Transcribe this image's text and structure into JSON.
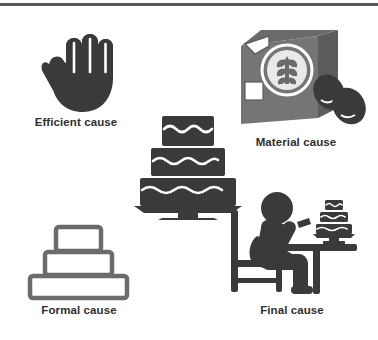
{
  "figure": {
    "background_color": "#ffffff",
    "rule_color": "#575757",
    "dark_fill": "#3a3a3a",
    "mid_fill": "#6f6f6f",
    "light_fill": "#8f8f8f",
    "outline_color": "#6b6b6b",
    "caption_color": "#2f2f2f"
  },
  "nodes": [
    {
      "id": "efficient",
      "label": "Efficient cause",
      "icon": "open-hand-icon"
    },
    {
      "id": "material",
      "label": "Material cause",
      "icon": "flour-box-and-eggs-icon"
    },
    {
      "id": "formal",
      "label": "Formal cause",
      "icon": "cake-outline-icon"
    },
    {
      "id": "final",
      "label": "Final cause",
      "icon": "person-eating-cake-at-table-icon"
    }
  ],
  "center": {
    "id": "center-cake",
    "icon": "three-tier-cake-on-stand-icon",
    "label": ""
  }
}
